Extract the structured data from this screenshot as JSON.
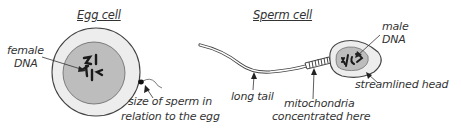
{
  "diagram": {
    "egg": {
      "title": "Egg cell",
      "labels": {
        "female_dna": [
          "female",
          "DNA"
        ],
        "sperm_size": [
          "size of sperm in",
          "relation to the egg"
        ]
      }
    },
    "sperm": {
      "title": "Sperm cell",
      "labels": {
        "male_dna": [
          "male",
          "DNA"
        ],
        "head": "streamlined head",
        "tail": "long tail",
        "mitochondria": [
          "mitochondria",
          "concentrated here"
        ]
      }
    },
    "colors": {
      "outline": "#333333",
      "membrane_fill": "#ededed",
      "nucleus_fill": "#bdbdbd",
      "dna": "#1a1a1a"
    }
  }
}
